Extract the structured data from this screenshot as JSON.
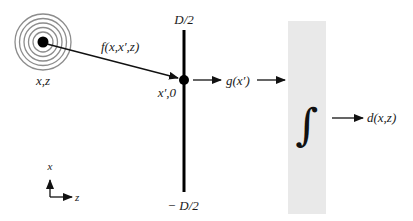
{
  "diagram": {
    "source": {
      "label": "x,z",
      "ring_count": 6,
      "ring_color": "#8a8a8a",
      "dot_color": "#000000"
    },
    "propagation": {
      "label": "f(x,x′,z)"
    },
    "aperture": {
      "top_label": "D/2",
      "bottom_label": "− D/2",
      "point_label": "x′,0"
    },
    "signal": {
      "label": "g(x′)"
    },
    "integrator": {
      "symbol": "∫",
      "fill_color": "#e8e8e8"
    },
    "output": {
      "label": "d(x,z)"
    },
    "axes": {
      "vertical_label": "x",
      "horizontal_label": "z"
    }
  }
}
